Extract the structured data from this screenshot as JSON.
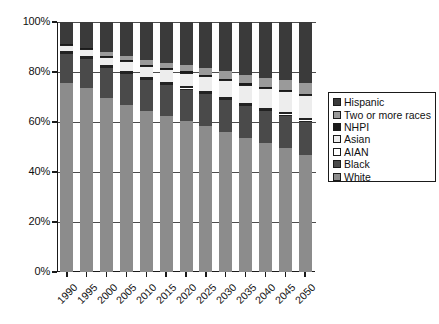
{
  "chart_data": {
    "type": "bar",
    "subtype": "stacked-percent",
    "title": "",
    "xlabel": "",
    "ylabel": "",
    "ylim": [
      0,
      100
    ],
    "ytick_labels": [
      "0%",
      "20%",
      "40%",
      "60%",
      "80%",
      "100%"
    ],
    "ytick_values": [
      0,
      20,
      40,
      60,
      80,
      100
    ],
    "grid": true,
    "grid_axis": "y",
    "legend_position": "right",
    "categories": [
      "1990",
      "1995",
      "2000",
      "2005",
      "2010",
      "2015",
      "2020",
      "2025",
      "2030",
      "2035",
      "2040",
      "2045",
      "2050"
    ],
    "series": [
      {
        "name": "White",
        "color": "#8c8c8c",
        "values": [
          75.5,
          73.5,
          69.5,
          67.0,
          64.5,
          62.5,
          60.5,
          58.5,
          56.0,
          53.5,
          51.5,
          49.5,
          47.0
        ]
      },
      {
        "name": "Black",
        "color": "#4a4a4a",
        "values": [
          11.8,
          11.9,
          12.1,
          12.2,
          12.3,
          12.4,
          12.5,
          12.6,
          12.7,
          12.8,
          12.9,
          13.0,
          13.1
        ]
      },
      {
        "name": "AIAN",
        "color": "#ffffff",
        "values": [
          0.7,
          0.7,
          0.8,
          0.8,
          0.8,
          0.9,
          0.9,
          0.9,
          1.0,
          1.0,
          1.0,
          1.1,
          1.1
        ]
      },
      {
        "name": "Asian",
        "color": "#ededed",
        "values": [
          2.8,
          3.3,
          3.8,
          4.3,
          4.8,
          5.3,
          5.9,
          6.5,
          7.1,
          7.7,
          8.3,
          8.9,
          9.5
        ]
      },
      {
        "name": "NHPI",
        "color": "#1a1a1a",
        "values": [
          0.4,
          0.4,
          0.4,
          0.4,
          0.4,
          0.4,
          0.5,
          0.5,
          0.5,
          0.5,
          0.5,
          0.5,
          0.6
        ]
      },
      {
        "name": "Two or more races",
        "color": "#9a9a9a",
        "values": [
          0.0,
          0.0,
          1.5,
          1.7,
          1.9,
          2.1,
          2.4,
          2.7,
          3.0,
          3.3,
          3.6,
          3.9,
          4.2
        ]
      },
      {
        "name": "Hispanic",
        "color": "#3a3a3a",
        "values": [
          8.8,
          10.2,
          11.9,
          13.6,
          15.3,
          16.4,
          17.3,
          18.3,
          19.7,
          21.2,
          22.2,
          23.1,
          24.5
        ]
      }
    ],
    "legend_entries": [
      {
        "label": "Hispanic",
        "color": "#3a3a3a"
      },
      {
        "label": "Two or more races",
        "color": "#9a9a9a"
      },
      {
        "label": "NHPI",
        "color": "#1a1a1a"
      },
      {
        "label": "Asian",
        "color": "#ededed"
      },
      {
        "label": "AIAN",
        "color": "#ffffff"
      },
      {
        "label": "Black",
        "color": "#4a4a4a"
      },
      {
        "label": "White",
        "color": "#8c8c8c"
      }
    ]
  }
}
